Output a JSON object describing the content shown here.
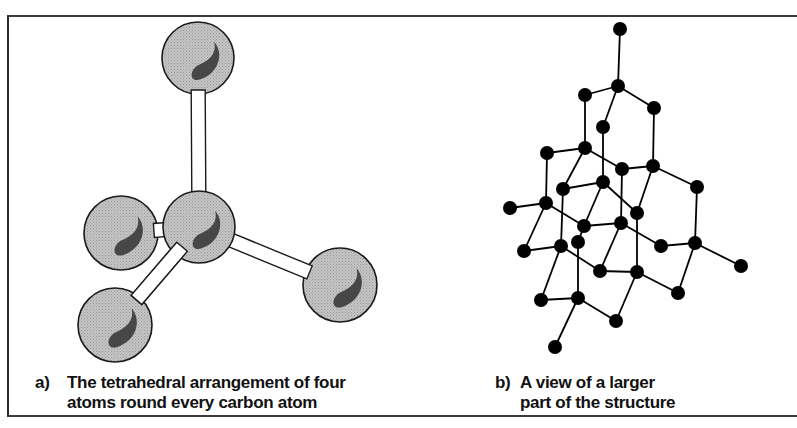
{
  "figure": {
    "panel_a": {
      "label": "a)",
      "caption_line1": "The tetrahedral arrangement of four",
      "caption_line2": "atoms round every carbon atom",
      "sphere_fill": "#b9b9b9",
      "highlight_fill": "#333333",
      "spheres": [
        {
          "id": "top",
          "cx": 198,
          "cy": 58,
          "r": 36
        },
        {
          "id": "left",
          "cx": 121,
          "cy": 233,
          "r": 37
        },
        {
          "id": "bottom-left",
          "cx": 115,
          "cy": 325,
          "r": 37
        },
        {
          "id": "right",
          "cx": 340,
          "cy": 285,
          "r": 37
        },
        {
          "id": "center",
          "cx": 199,
          "cy": 227,
          "r": 36
        }
      ],
      "bonds": [
        {
          "from": "center",
          "to": "top"
        },
        {
          "from": "center",
          "to": "left"
        },
        {
          "from": "center",
          "to": "bottom-left"
        },
        {
          "from": "center",
          "to": "right"
        }
      ]
    },
    "panel_b": {
      "label": "b)",
      "caption_line1": "A view of a larger",
      "caption_line2": "part of the structure",
      "node_color": "#000000",
      "node_radius": 7,
      "nodes": {
        "A": [
          620,
          29
        ],
        "B": [
          618,
          86
        ],
        "C": [
          585,
          95
        ],
        "D": [
          654,
          108
        ],
        "E": [
          603,
          127
        ],
        "F": [
          547,
          153
        ],
        "G": [
          585,
          148
        ],
        "H": [
          622,
          169
        ],
        "I": [
          653,
          166
        ],
        "J": [
          697,
          187
        ],
        "K": [
          563,
          189
        ],
        "L": [
          603,
          182
        ],
        "M": [
          510,
          208
        ],
        "N": [
          546,
          203
        ],
        "O": [
          637,
          213
        ],
        "P": [
          584,
          226
        ],
        "Q": [
          621,
          223
        ],
        "R": [
          524,
          251
        ],
        "S": [
          561,
          246
        ],
        "T": [
          578,
          242
        ],
        "U": [
          661,
          246
        ],
        "V": [
          695,
          243
        ],
        "W": [
          741,
          266
        ],
        "X": [
          600,
          271
        ],
        "Y": [
          637,
          272
        ],
        "Z": [
          541,
          300
        ],
        "AA": [
          578,
          298
        ],
        "AB": [
          678,
          293
        ],
        "AC": [
          616,
          321
        ],
        "AD": [
          555,
          347
        ]
      },
      "edges": [
        [
          "A",
          "B"
        ],
        [
          "B",
          "C"
        ],
        [
          "B",
          "D"
        ],
        [
          "B",
          "E"
        ],
        [
          "C",
          "G"
        ],
        [
          "D",
          "I"
        ],
        [
          "E",
          "L"
        ],
        [
          "F",
          "G"
        ],
        [
          "F",
          "N"
        ],
        [
          "G",
          "K"
        ],
        [
          "G",
          "H"
        ],
        [
          "H",
          "I"
        ],
        [
          "H",
          "Q"
        ],
        [
          "I",
          "J"
        ],
        [
          "I",
          "O"
        ],
        [
          "J",
          "V"
        ],
        [
          "K",
          "L"
        ],
        [
          "K",
          "S"
        ],
        [
          "L",
          "P"
        ],
        [
          "L",
          "O"
        ],
        [
          "M",
          "N"
        ],
        [
          "N",
          "P"
        ],
        [
          "N",
          "R"
        ],
        [
          "P",
          "Q"
        ],
        [
          "P",
          "T"
        ],
        [
          "Q",
          "U"
        ],
        [
          "Q",
          "X"
        ],
        [
          "O",
          "Y"
        ],
        [
          "R",
          "S"
        ],
        [
          "S",
          "X"
        ],
        [
          "S",
          "Z"
        ],
        [
          "T",
          "AA"
        ],
        [
          "U",
          "V"
        ],
        [
          "V",
          "W"
        ],
        [
          "V",
          "AB"
        ],
        [
          "X",
          "Y"
        ],
        [
          "Y",
          "AB"
        ],
        [
          "Y",
          "AC"
        ],
        [
          "Z",
          "AA"
        ],
        [
          "AA",
          "AC"
        ],
        [
          "AA",
          "AD"
        ]
      ]
    }
  }
}
